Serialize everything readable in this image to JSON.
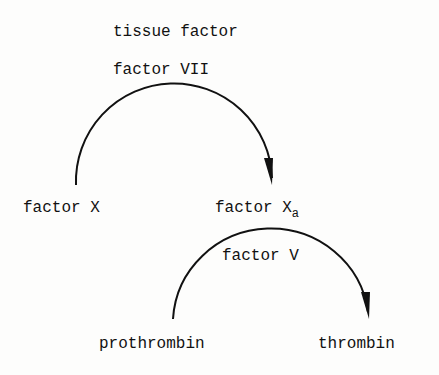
{
  "diagram": {
    "labels": {
      "tissue_factor": "tissue factor",
      "factor_vii": "factor VII",
      "factor_x": "factor X",
      "factor_xa_base": "factor X",
      "factor_xa_sub": "a",
      "factor_v": "factor V",
      "prothrombin": "prothrombin",
      "thrombin": "thrombin"
    },
    "edges": [
      {
        "from": "factor X",
        "to": "factor Xa",
        "catalysts": [
          "tissue factor",
          "factor VII"
        ]
      },
      {
        "from": "prothrombin",
        "to": "thrombin",
        "catalysts": [
          "factor Xa",
          "factor V"
        ]
      }
    ]
  }
}
